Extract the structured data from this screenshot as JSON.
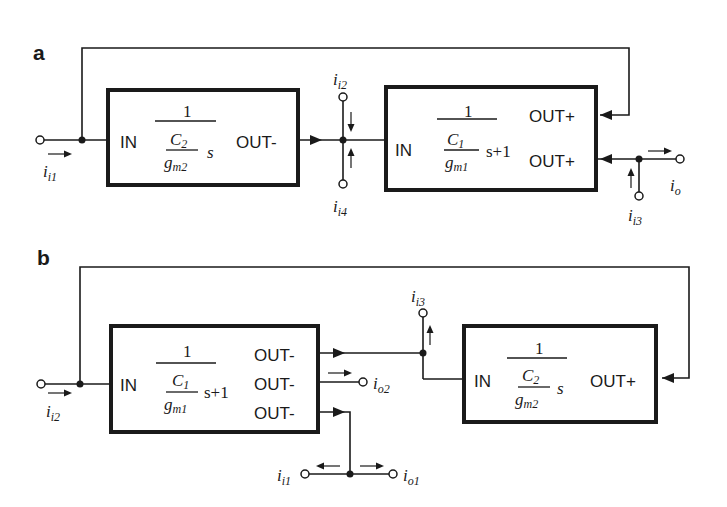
{
  "panels": {
    "a": {
      "label": "a",
      "block1": {
        "in": "IN",
        "out": "OUT-",
        "numerator": "1",
        "cap": "C",
        "cap_sub": "2",
        "gm": "g",
        "gm_sub": "m2",
        "tail": "s"
      },
      "block2": {
        "in": "IN",
        "out1": "OUT+",
        "out2": "OUT+",
        "numerator": "1",
        "cap": "C",
        "cap_sub": "1",
        "gm": "g",
        "gm_sub": "m1",
        "tail": "s+1"
      },
      "currents": {
        "ii1": {
          "main": "i",
          "sub": "i1"
        },
        "ii2": {
          "main": "i",
          "sub": "i2"
        },
        "ii4": {
          "main": "i",
          "sub": "i4"
        },
        "ii3": {
          "main": "i",
          "sub": "i3"
        },
        "io": {
          "main": "i",
          "sub": "o"
        }
      }
    },
    "b": {
      "label": "b",
      "block1": {
        "in": "IN",
        "out1": "OUT-",
        "out2": "OUT-",
        "out3": "OUT-",
        "numerator": "1",
        "cap": "C",
        "cap_sub": "1",
        "gm": "g",
        "gm_sub": "m1",
        "tail": "s+1"
      },
      "block2": {
        "in": "IN",
        "out": "OUT+",
        "numerator": "1",
        "cap": "C",
        "cap_sub": "2",
        "gm": "g",
        "gm_sub": "m2",
        "tail": "s"
      },
      "currents": {
        "ii2": {
          "main": "i",
          "sub": "i2"
        },
        "ii3": {
          "main": "i",
          "sub": "i3"
        },
        "io2": {
          "main": "i",
          "sub": "o2"
        },
        "ii1": {
          "main": "i",
          "sub": "i1"
        },
        "io1": {
          "main": "i",
          "sub": "o1"
        }
      }
    }
  }
}
